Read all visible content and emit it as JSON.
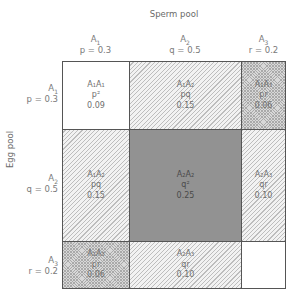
{
  "diagram": {
    "sperm_pool_label": "Sperm pool",
    "egg_pool_label": "Egg pool",
    "alleles": [
      {
        "name": "A",
        "sub": "1",
        "freq_label": "p = 0.3",
        "symbol": "p",
        "value": 0.3
      },
      {
        "name": "A",
        "sub": "2",
        "freq_label": "q = 0.5",
        "symbol": "q",
        "value": 0.5
      },
      {
        "name": "A",
        "sub": "3",
        "freq_label": "r = 0.2",
        "symbol": "r",
        "value": 0.2
      }
    ],
    "cells": [
      [
        {
          "genotype": "A₁A₁",
          "expr": "p²",
          "value": "0.09",
          "fill": "white"
        },
        {
          "genotype": "A₁A₂",
          "expr": "pq",
          "value": "0.15",
          "fill": "hatch"
        },
        {
          "genotype": "A₁A₃",
          "expr": "pr",
          "value": "0.06",
          "fill": "cross"
        }
      ],
      [
        {
          "genotype": "A₁A₂",
          "expr": "pq",
          "value": "0.15",
          "fill": "hatch"
        },
        {
          "genotype": "A₂A₂",
          "expr": "q²",
          "value": "0.25",
          "fill": "solid"
        },
        {
          "genotype": "A₂A₃",
          "expr": "qr",
          "value": "0.10",
          "fill": "hatch"
        }
      ],
      [
        {
          "genotype": "A₁A₃",
          "expr": "pr",
          "value": "0.06",
          "fill": "cross"
        },
        {
          "genotype": "A₂A₃",
          "expr": "qr",
          "value": "0.10",
          "fill": "hatch"
        },
        {
          "genotype": "",
          "expr": "",
          "value": "",
          "fill": "white"
        }
      ]
    ],
    "colors": {
      "border": "#555555",
      "solid_fill": "#929292",
      "hatch_line": "#bdbdbd",
      "cross_fill": "#d8d8d8",
      "text": "#7a7a7a"
    }
  }
}
